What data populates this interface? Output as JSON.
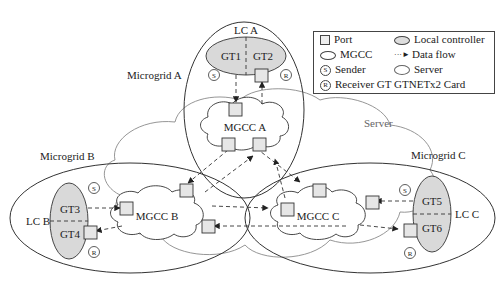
{
  "diagram": {
    "type": "network-architecture",
    "colors": {
      "controller_fill": "#d9d9d9",
      "port_fill": "#e6e6e6",
      "line": "#333333",
      "server_line": "#888888"
    },
    "server_label": "Server",
    "microgrids": [
      {
        "label": "Microgrid A",
        "lc": "LC A",
        "gts": [
          "GT1",
          "GT2"
        ],
        "mgcc": "MGCC A",
        "sender": "S",
        "receiver": "R"
      },
      {
        "label": "Microgrid B",
        "lc": "LC B",
        "gts": [
          "GT3",
          "GT4"
        ],
        "mgcc": "MGCC B",
        "sender": "S",
        "receiver": "R"
      },
      {
        "label": "Microgrid C",
        "lc": "LC C",
        "gts": [
          "GT5",
          "GT6"
        ],
        "mgcc": "MGCC C",
        "sender": "S",
        "receiver": "R"
      }
    ],
    "flows": [
      {
        "from": "GT1",
        "to": "MGCC A"
      },
      {
        "from": "MGCC A",
        "to": "GT2"
      },
      {
        "from": "GT3",
        "to": "MGCC B"
      },
      {
        "from": "MGCC B",
        "to": "GT4"
      },
      {
        "from": "GT5",
        "to": "MGCC C"
      },
      {
        "from": "MGCC C",
        "to": "GT6"
      },
      {
        "from": "MGCC A",
        "to": "MGCC B"
      },
      {
        "from": "MGCC B",
        "to": "MGCC A"
      },
      {
        "from": "MGCC A",
        "to": "MGCC C"
      },
      {
        "from": "MGCC C",
        "to": "MGCC A"
      },
      {
        "from": "MGCC B",
        "to": "MGCC C"
      },
      {
        "from": "MGCC C",
        "to": "MGCC B"
      }
    ]
  },
  "legend": {
    "port": "Port",
    "local_controller": "Local controller",
    "mgcc": "MGCC",
    "data_flow": "Data flow",
    "sender": "Sender",
    "server": "Server",
    "receiver": "Receiver GT GTNETx2 Card",
    "sender_symbol": "S",
    "receiver_symbol": "R"
  }
}
